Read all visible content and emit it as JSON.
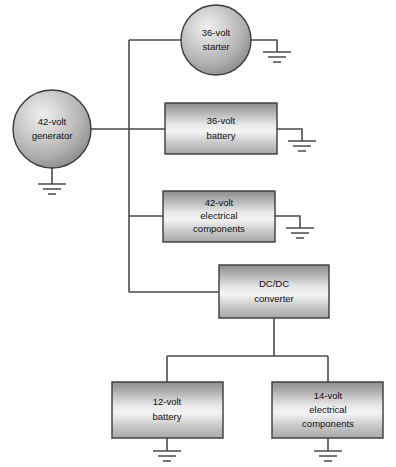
{
  "diagram": {
    "background_color": "#ffffff",
    "wire_color": "#4a4a4a",
    "shape_stroke_color": "#3b3b3b",
    "shape_fill_light": "#f2f2f2",
    "shape_fill_mid": "#b8b8b8",
    "shape_fill_dark": "#8f8f8f",
    "nodes": [
      {
        "id": "generator",
        "shape": "circle",
        "lines": [
          "42-volt",
          "generator"
        ],
        "cx": 52,
        "cy": 129,
        "r": 39,
        "has_ground": true,
        "ground_side": "bottom"
      },
      {
        "id": "starter",
        "shape": "circle",
        "lines": [
          "36-volt",
          "starter"
        ],
        "cx": 216,
        "cy": 40,
        "r": 35,
        "has_ground": true,
        "ground_side": "right"
      },
      {
        "id": "battery-36v",
        "shape": "rect",
        "lines": [
          "36-volt",
          "battery"
        ],
        "x": 165,
        "y": 103,
        "width": 112,
        "height": 51,
        "has_ground": true,
        "ground_side": "right"
      },
      {
        "id": "components-42v",
        "shape": "rect",
        "lines": [
          "42-volt",
          "electrical",
          "components"
        ],
        "x": 163,
        "y": 191,
        "width": 112,
        "height": 51,
        "has_ground": true,
        "ground_side": "right"
      },
      {
        "id": "dcdc-converter",
        "shape": "rect",
        "lines": [
          "DC/DC",
          "converter"
        ],
        "x": 219,
        "y": 265,
        "width": 110,
        "height": 53,
        "has_ground": false,
        "ground_side": ""
      },
      {
        "id": "battery-12v",
        "shape": "rect",
        "lines": [
          "12-volt",
          "battery"
        ],
        "x": 112,
        "y": 382,
        "width": 111,
        "height": 56,
        "has_ground": true,
        "ground_side": "bottom"
      },
      {
        "id": "components-14v",
        "shape": "rect",
        "lines": [
          "14-volt",
          "electrical",
          "components"
        ],
        "x": 272,
        "y": 382,
        "width": 111,
        "height": 56,
        "has_ground": true,
        "ground_side": "bottom"
      }
    ],
    "bus": {
      "name": "42-volt-bus",
      "vertical_x": 129,
      "top_y": 40,
      "bottom_y": 292
    },
    "caption": ""
  }
}
